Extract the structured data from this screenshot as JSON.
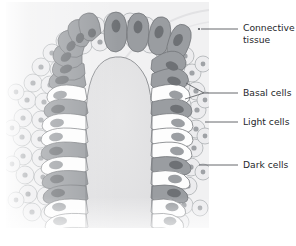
{
  "figure": {
    "kind": "histology-illustration",
    "background_color": "#f2f2f3",
    "page_color": "#ffffff"
  },
  "labels": [
    {
      "id": "connective-tissue",
      "line1": "Connective",
      "line2": "tissue",
      "text": "Connective tissue",
      "text_x": 243,
      "text_y": 31,
      "line_x1": 199,
      "line_y1": 29,
      "line_x2": 238,
      "line_y2": 29,
      "dots": [
        {
          "x": 199,
          "y": 29
        }
      ]
    },
    {
      "id": "basal-cells",
      "line1": "Basal cells",
      "line2": "",
      "text": "Basal cells",
      "text_x": 243,
      "text_y": 96,
      "line_x1": 204,
      "line_y1": 93,
      "line_x2": 238,
      "line_y2": 93,
      "fork": [
        {
          "x1": 204,
          "y1": 93,
          "x2": 186,
          "y2": 83
        },
        {
          "x1": 204,
          "y1": 93,
          "x2": 185,
          "y2": 99
        }
      ]
    },
    {
      "id": "light-cells",
      "line1": "Light cells",
      "line2": "",
      "text": "Light cells",
      "text_x": 243,
      "text_y": 125,
      "line_x1": 205,
      "line_y1": 122,
      "line_x2": 238,
      "line_y2": 122
    },
    {
      "id": "dark-cells",
      "line1": "Dark cells",
      "line2": "",
      "text": "Dark cells",
      "text_x": 243,
      "text_y": 168,
      "line_x1": 199,
      "line_y1": 165,
      "line_x2": 238,
      "line_y2": 165
    }
  ],
  "palette": {
    "background": "#f1f1f2",
    "lumen": "#e2e2e3",
    "dark_cell_fill": "#9a9da1",
    "dark_cell_nucleus": "#6e7175",
    "light_cell_fill": "#fdfdfd",
    "light_cell_nucleus": "#9b9ea2",
    "connective_fill": "#ececee",
    "connective_nucleus": "#9fa2a6",
    "outline": "#6d7074",
    "leader_line": "#55585c",
    "label_text": "#26272b"
  },
  "structures": {
    "lumen_label": "lumen",
    "epithelium_label": "epithelium",
    "connective_label": "connective tissue stroma"
  }
}
